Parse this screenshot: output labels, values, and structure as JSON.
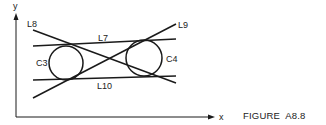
{
  "figure": {
    "caption": "FIGURE  A8.8",
    "axes": {
      "x_label": "x",
      "y_label": "y"
    },
    "lines": [
      {
        "id": "L7",
        "label": "L7"
      },
      {
        "id": "L8",
        "label": "L8"
      },
      {
        "id": "L9",
        "label": "L9"
      },
      {
        "id": "L10",
        "label": "L10"
      }
    ],
    "circles": [
      {
        "id": "C3",
        "label": "C3"
      },
      {
        "id": "C4",
        "label": "C4"
      }
    ],
    "colors": {
      "ink": "#1a1a1a",
      "background": "#ffffff"
    }
  }
}
